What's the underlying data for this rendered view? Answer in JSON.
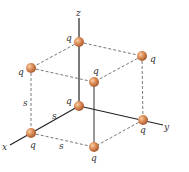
{
  "diagram": {
    "axes": {
      "x_label": "x",
      "y_label": "y",
      "z_label": "z"
    },
    "charge_label": "q",
    "side_label": "s",
    "colors": {
      "sphere": "#d98a55",
      "sphere_highlight": "#f5c49a",
      "sphere_shadow": "#a85a2a",
      "lines": "#444444"
    },
    "charges": [
      {
        "id": "origin",
        "label": "q"
      },
      {
        "id": "top-back",
        "label": "q"
      },
      {
        "id": "x-corner",
        "label": "q"
      },
      {
        "id": "front-bottom",
        "label": "q"
      },
      {
        "id": "y-corner",
        "label": "q"
      },
      {
        "id": "top-left",
        "label": "q"
      },
      {
        "id": "top-front",
        "label": "q"
      },
      {
        "id": "top-right",
        "label": "q"
      }
    ],
    "sides": [
      {
        "id": "vertical-left",
        "label": "s"
      },
      {
        "id": "along-x",
        "label": "s"
      },
      {
        "id": "bottom-front",
        "label": "s"
      }
    ]
  }
}
